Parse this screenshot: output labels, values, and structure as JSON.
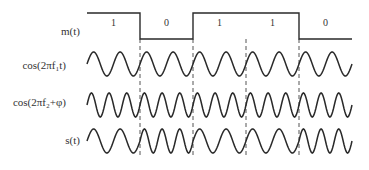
{
  "colors": {
    "line": "#2a2a2a",
    "dash": "#555555",
    "text": "#333333"
  },
  "signals": [
    {
      "id": "m",
      "label": "m(t)",
      "y": 32
    },
    {
      "id": "f1",
      "label": "cos(2πf₁t)",
      "y": 66
    },
    {
      "id": "f2",
      "label": "cos(2πf₂+φ)",
      "y": 104
    },
    {
      "id": "s",
      "label": "s(t)",
      "y": 141
    }
  ],
  "bits": [
    "1",
    "0",
    "1",
    "1",
    "0"
  ],
  "layout": {
    "x_start": 87,
    "bit_width": 53,
    "m_high": 13,
    "m_low": 39,
    "bit_label_y": 17,
    "amplitude": 12,
    "cycles_per_bit_f1": 2,
    "cycles_per_bit_f2": 3,
    "f1_center": 64,
    "f2_center": 105,
    "s_center": 141,
    "dash_top": 39,
    "dash_bottom": 155
  },
  "modulation": {
    "bit_1": "f1",
    "bit_0": "f2"
  }
}
